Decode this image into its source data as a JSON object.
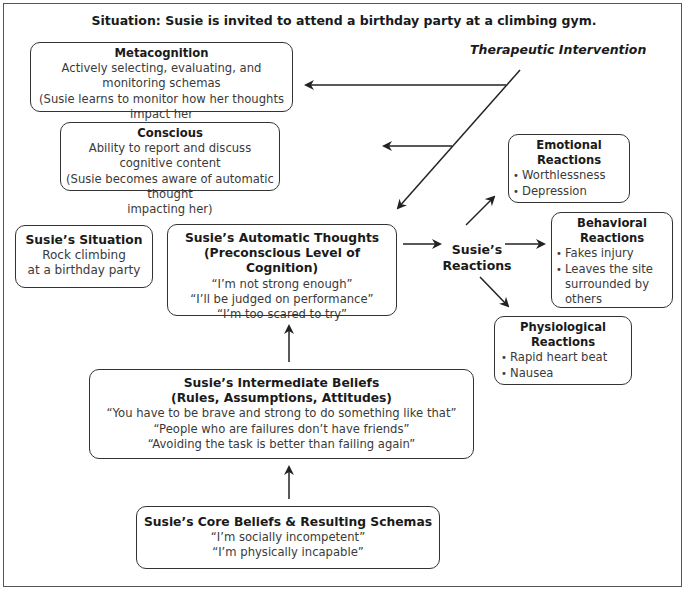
{
  "title": "Situation: Susie is invited to attend a birthday party at a climbing gym.",
  "therapeutic_intervention": "Therapeutic Intervention",
  "metacognition": {
    "heading": "Metacognition",
    "lines": [
      "Actively selecting, evaluating, and monitoring schemas",
      "(Susie learns to monitor how her thoughts impact her",
      "emotions & behavior)"
    ]
  },
  "conscious": {
    "heading": "Conscious",
    "lines": [
      "Ability to report and discuss cognitive content",
      "(Susie becomes aware of automatic thought",
      "impacting her)"
    ]
  },
  "situation": {
    "heading": "Susie’s Situation",
    "lines": [
      "Rock climbing",
      "at a birthday party"
    ]
  },
  "automatic_thoughts": {
    "heading_1": "Susie’s Automatic Thoughts",
    "heading_2": "(Preconscious Level of Cognition)",
    "lines": [
      "“I’m not strong enough”",
      "“I’ll be judged on performance”",
      "“I’m too scared to try”"
    ]
  },
  "reactions": {
    "line_1": "Susie’s",
    "line_2": "Reactions"
  },
  "emotional": {
    "heading_1": "Emotional",
    "heading_2": "Reactions",
    "items": [
      "Worthlessness",
      "Depression"
    ]
  },
  "behavioral": {
    "heading_1": "Behavioral",
    "heading_2": "Reactions",
    "items": [
      "Fakes injury",
      "Leaves the site surrounded by others"
    ]
  },
  "physiological": {
    "heading_1": "Physiological",
    "heading_2": "Reactions",
    "items": [
      "Rapid heart beat",
      "Nausea"
    ]
  },
  "intermediate": {
    "heading_1": "Susie’s Intermediate Beliefs",
    "heading_2": "(Rules, Assumptions, Attitudes)",
    "lines": [
      "“You have to be brave and strong to do something like that”",
      "“People who are failures don’t have friends”",
      "“Avoiding the task is better than failing again”"
    ]
  },
  "core": {
    "heading": "Susie’s Core Beliefs & Resulting Schemas",
    "lines": [
      "“I’m socially incompetent”",
      "“I’m physically incapable”"
    ]
  },
  "colors": {
    "stroke": "#333333",
    "text": "#3a3a3a",
    "heading": "#1a1a1a",
    "background": "#ffffff"
  }
}
